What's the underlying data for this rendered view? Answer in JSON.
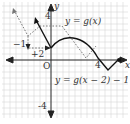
{
  "diagram": {
    "type": "function-transformation-graph",
    "axes": {
      "x_label": "x",
      "y_label": "y",
      "origin_label": "O",
      "x_tick_label": "4",
      "y_top_tick_label": "4",
      "y_bottom_tick_label": "-4"
    },
    "curves": [
      {
        "name": "original",
        "label": "y = g(x)",
        "style": "dashed"
      },
      {
        "name": "transformed",
        "label": "y = g(x − 2) − 1",
        "style": "solid"
      }
    ],
    "annotations": {
      "shift_down": "−1",
      "shift_right": "+2"
    },
    "colors": {
      "grid": "#d6d6d6",
      "axis": "#222222",
      "dashed_curve": "#777777",
      "solid_curve": "#111111"
    }
  }
}
